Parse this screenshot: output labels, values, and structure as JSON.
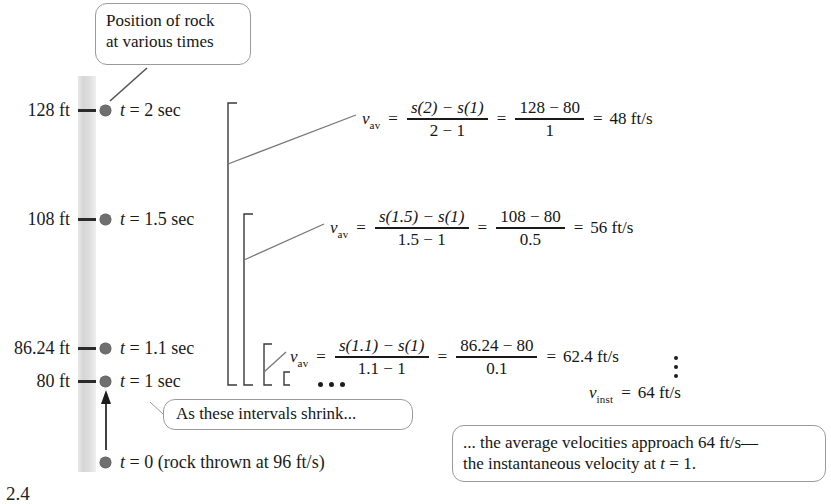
{
  "figure": {
    "caption": "2.4"
  },
  "callouts": {
    "position_note": {
      "line1": "Position of rock",
      "line2": "at various times"
    },
    "shrink_note": "As these intervals shrink...",
    "conclusion": {
      "line1": "... the average velocities approach 64 ft/s—",
      "line2_a": "the instantaneous velocity at ",
      "line2_var": "t",
      "line2_b": " = 1."
    }
  },
  "positions": [
    {
      "height": "128 ft",
      "time_var": "t",
      "time_eq": " = 2 sec"
    },
    {
      "height": "108 ft",
      "time_var": "t",
      "time_eq": " = 1.5 sec"
    },
    {
      "height": "86.24 ft",
      "time_var": "t",
      "time_eq": " = 1.1 sec"
    },
    {
      "height": "80 ft",
      "time_var": "t",
      "time_eq": " = 1 sec"
    }
  ],
  "origin": {
    "time_var": "t",
    "text": " = 0 (rock thrown at 96 ft/s)"
  },
  "equations": [
    {
      "lhs_var": "v",
      "lhs_sub": "av",
      "num1": "s(2) − s(1)",
      "den1": "2 − 1",
      "num2": "128 − 80",
      "den2": "1",
      "result": "48 ft/s"
    },
    {
      "lhs_var": "v",
      "lhs_sub": "av",
      "num1": "s(1.5) − s(1)",
      "den1": "1.5 − 1",
      "num2": "108 − 80",
      "den2": "0.5",
      "result": "56 ft/s"
    },
    {
      "lhs_var": "v",
      "lhs_sub": "av",
      "num1": "s(1.1) − s(1)",
      "den1": "1.1 − 1",
      "num2": "86.24 − 80",
      "den2": "0.1",
      "result": "62.4 ft/s"
    }
  ],
  "limit": {
    "lhs_var": "v",
    "lhs_sub": "inst",
    "equals": "=",
    "result": "64 ft/s"
  },
  "symbols": {
    "equals": "=",
    "ellipsis_horizontal": "• • •",
    "ellipsis_vertical": "vertical-dots"
  },
  "colors": {
    "ink": "#1a1a1a",
    "dot": "#6f6f6f",
    "bar_grey": "#dcdcdc",
    "callout_border": "#9a9a9a",
    "leader_line": "#6b6b6b"
  }
}
